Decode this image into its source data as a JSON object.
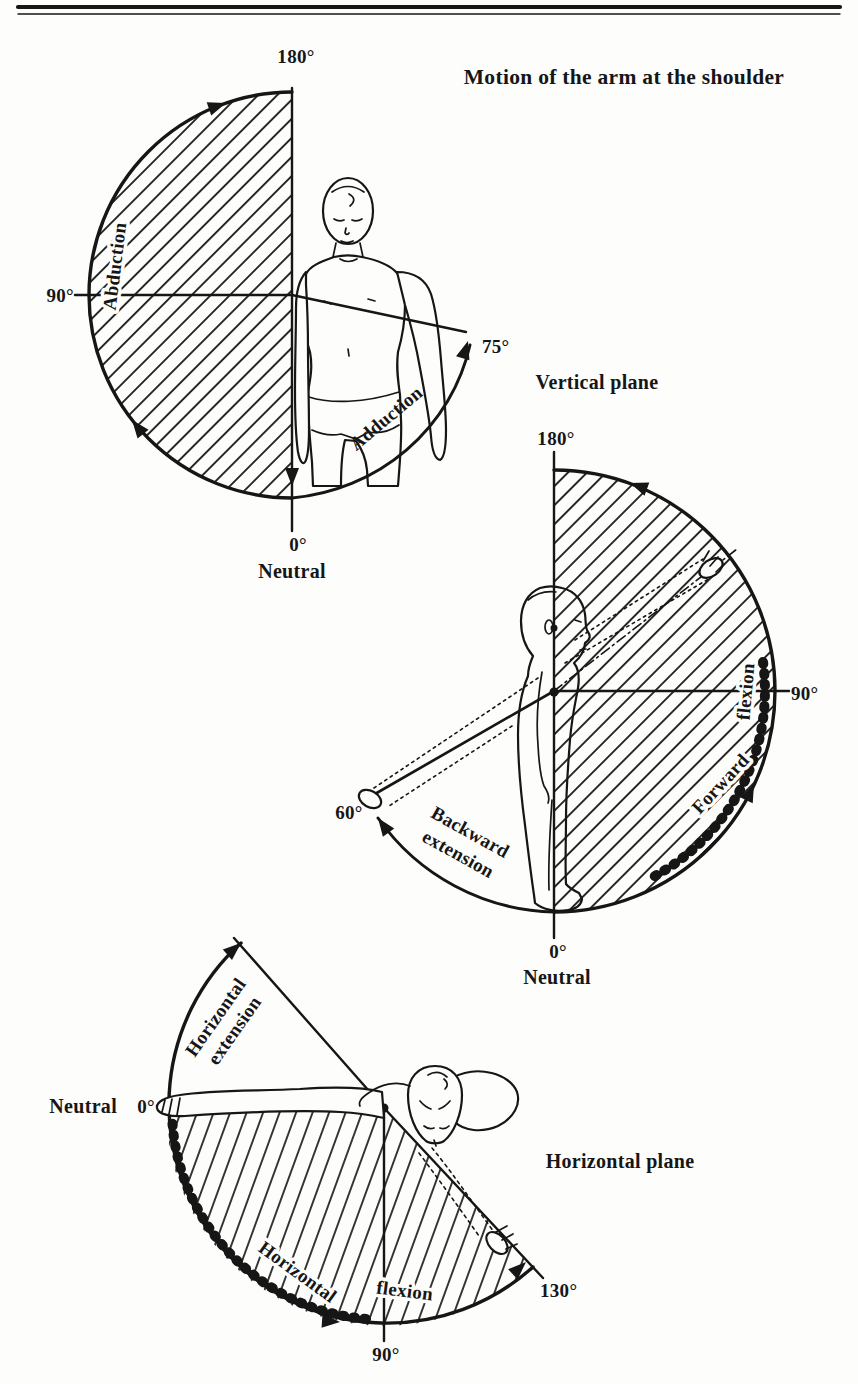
{
  "page": {
    "title": "Motion of the arm at the shoulder"
  },
  "frontal_diagram": {
    "label_180": "180°",
    "label_90": "90°",
    "label_75": "75°",
    "label_0": "0°",
    "label_neutral": "Neutral",
    "motion_abduction": "Abduction",
    "motion_adduction": "Adduction"
  },
  "vertical_diagram": {
    "caption": "Vertical plane",
    "label_180": "180°",
    "label_90": "90°",
    "label_60": "60°",
    "label_0": "0°",
    "label_neutral": "Neutral",
    "motion_forward_flexion": [
      "Forward",
      "flexion"
    ],
    "motion_backward_extension": [
      "Backward",
      "extension"
    ]
  },
  "horizontal_diagram": {
    "caption": "Horizontal plane",
    "label_neutral": "Neutral",
    "label_0": "0°",
    "label_90": "90°",
    "label_130": "130°",
    "motion_horizontal_extension": [
      "Horizontal",
      "extension"
    ],
    "motion_horizontal_flexion": [
      "Horizontal",
      "flexion"
    ]
  }
}
